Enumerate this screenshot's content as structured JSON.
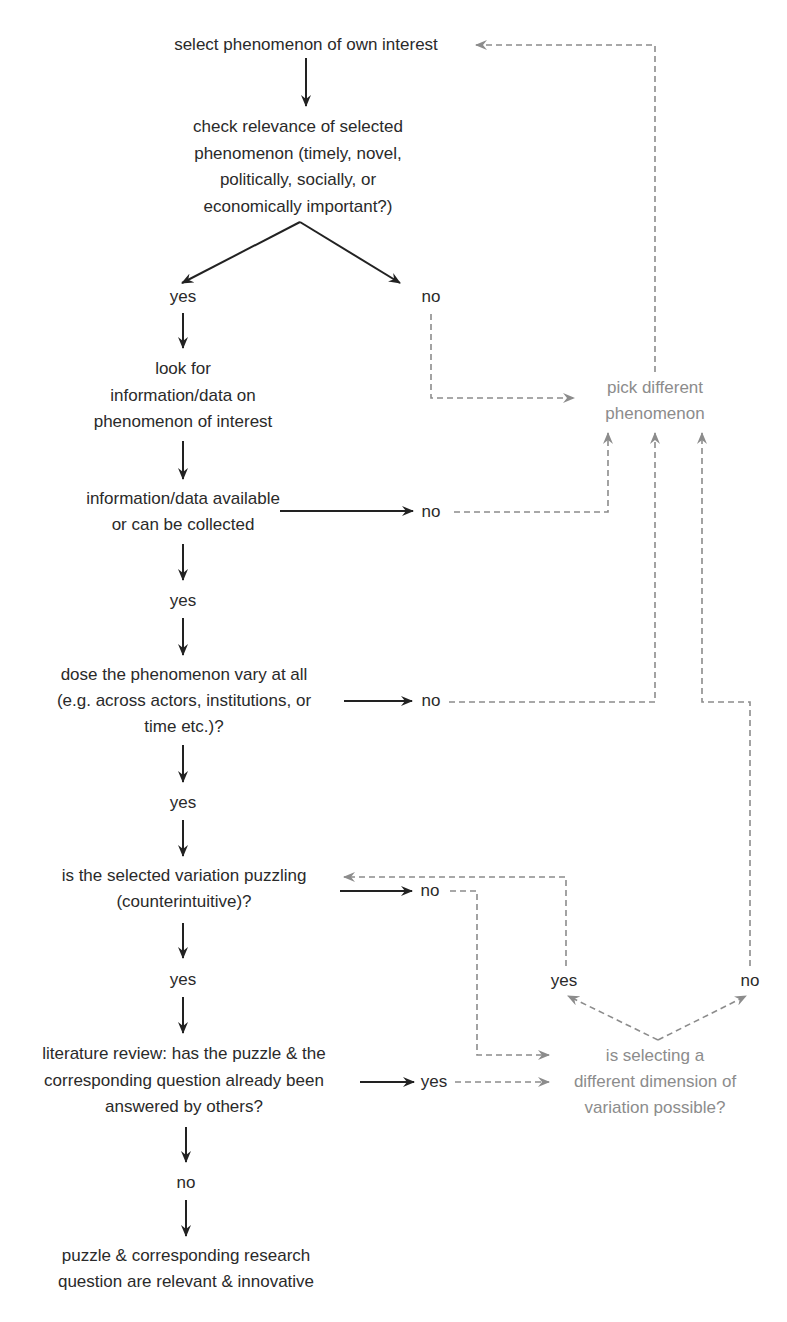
{
  "diagram": {
    "type": "flowchart",
    "colors": {
      "primary_text": "#2a2a2a",
      "secondary_text": "#8c8c8c",
      "solid_arrow": "#222222",
      "dashed_arrow": "#8c8c8c",
      "background": "#ffffff"
    },
    "nodes": {
      "start": "select phenomenon of own interest",
      "relevance_1": "check relevance of selected",
      "relevance_2": "phenomenon (timely, novel,",
      "relevance_3": "politically, socially, or",
      "relevance_4": "economically important?)",
      "relevance_yes": "yes",
      "relevance_no": "no",
      "look_1": "look for",
      "look_2": "information/data on",
      "look_3": "phenomenon of interest",
      "available_1": "information/data available",
      "available_2": "or can be collected",
      "available_no": "no",
      "available_yes": "yes",
      "vary_1": "dose the phenomenon vary at all",
      "vary_2": "(e.g. across actors, institutions, or",
      "vary_3": "time etc.)?",
      "vary_no": "no",
      "vary_yes": "yes",
      "puzzling_1": "is the selected variation puzzling",
      "puzzling_2": "(counterintuitive)?",
      "puzzling_no": "no",
      "puzzling_yes": "yes",
      "lit_1": "literature review: has the puzzle & the",
      "lit_2": "corresponding question already been",
      "lit_3": "answered by others?",
      "lit_yes": "yes",
      "lit_no": "no",
      "end_1": "puzzle & corresponding research",
      "end_2": "question are relevant & innovative",
      "pick_1": "pick different",
      "pick_2": "phenomenon",
      "dimension_1": "is selecting a",
      "dimension_2": "different dimension of",
      "dimension_3": "variation possible?",
      "dimension_yes": "yes",
      "dimension_no": "no"
    },
    "edges": [
      {
        "from": "start",
        "to": "relevance",
        "style": "solid"
      },
      {
        "from": "relevance",
        "to": "relevance_yes",
        "style": "solid"
      },
      {
        "from": "relevance",
        "to": "relevance_no",
        "style": "solid"
      },
      {
        "from": "relevance_no",
        "to": "pick",
        "style": "dashed"
      },
      {
        "from": "relevance_yes",
        "to": "look",
        "style": "solid"
      },
      {
        "from": "look",
        "to": "available",
        "style": "solid"
      },
      {
        "from": "available",
        "to": "available_no",
        "style": "solid"
      },
      {
        "from": "available_no",
        "to": "pick",
        "style": "dashed"
      },
      {
        "from": "available",
        "to": "available_yes",
        "style": "solid"
      },
      {
        "from": "available_yes",
        "to": "vary",
        "style": "solid"
      },
      {
        "from": "vary",
        "to": "vary_no",
        "style": "solid"
      },
      {
        "from": "vary_no",
        "to": "pick",
        "style": "dashed"
      },
      {
        "from": "vary",
        "to": "vary_yes",
        "style": "solid"
      },
      {
        "from": "vary_yes",
        "to": "puzzling",
        "style": "solid"
      },
      {
        "from": "puzzling",
        "to": "puzzling_no",
        "style": "solid"
      },
      {
        "from": "puzzling_no",
        "to": "dimension",
        "style": "dashed"
      },
      {
        "from": "puzzling",
        "to": "puzzling_yes",
        "style": "solid"
      },
      {
        "from": "puzzling_yes",
        "to": "lit",
        "style": "solid"
      },
      {
        "from": "lit",
        "to": "lit_yes",
        "style": "solid"
      },
      {
        "from": "lit_yes",
        "to": "dimension",
        "style": "dashed"
      },
      {
        "from": "lit",
        "to": "lit_no",
        "style": "solid"
      },
      {
        "from": "lit_no",
        "to": "end",
        "style": "solid"
      },
      {
        "from": "dimension",
        "to": "dimension_yes",
        "style": "dashed"
      },
      {
        "from": "dimension",
        "to": "dimension_no",
        "style": "dashed"
      },
      {
        "from": "dimension_yes",
        "to": "puzzling",
        "style": "dashed"
      },
      {
        "from": "dimension_no",
        "to": "pick",
        "style": "dashed"
      },
      {
        "from": "pick",
        "to": "start",
        "style": "dashed"
      }
    ]
  }
}
